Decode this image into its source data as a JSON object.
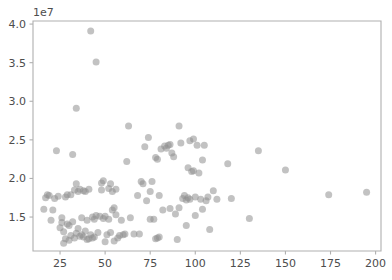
{
  "chart_data": {
    "type": "scatter",
    "title": "",
    "xlabel": "",
    "ylabel": "",
    "y_offset_text": "1e7",
    "xlim": [
      10,
      203
    ],
    "ylim": [
      10600000,
      40400000
    ],
    "xticks": [
      25,
      50,
      75,
      100,
      125,
      150,
      175,
      200
    ],
    "xtick_labels": [
      "25",
      "50",
      "75",
      "100",
      "125",
      "150",
      "175",
      "200"
    ],
    "yticks": [
      15000000,
      20000000,
      25000000,
      30000000,
      35000000,
      40000000
    ],
    "ytick_labels": [
      "1.5",
      "2.0",
      "2.5",
      "3.0",
      "3.5",
      "4.0"
    ],
    "grid": false,
    "legend": null,
    "marker": {
      "color": "#8f8f8f",
      "opacity": 0.55,
      "size_px": 7,
      "shape": "circle"
    },
    "background_color": "#ffffff",
    "spine_color": "#b0b0b0",
    "tick_label_color": "#4d4d4d",
    "series": [
      {
        "name": "points",
        "points": [
          [
            16,
            16000000
          ],
          [
            17,
            17500000
          ],
          [
            18,
            17900000
          ],
          [
            19,
            17800000
          ],
          [
            20,
            14600000
          ],
          [
            21,
            15900000
          ],
          [
            22,
            17400000
          ],
          [
            23,
            23600000
          ],
          [
            24,
            17700000
          ],
          [
            25,
            13600000
          ],
          [
            26,
            14900000
          ],
          [
            26,
            14300000
          ],
          [
            27,
            13100000
          ],
          [
            27,
            11600000
          ],
          [
            28,
            17600000
          ],
          [
            28,
            12200000
          ],
          [
            29,
            14100000
          ],
          [
            29,
            17900000
          ],
          [
            30,
            12000000
          ],
          [
            30,
            13900000
          ],
          [
            31,
            17900000
          ],
          [
            31,
            12600000
          ],
          [
            32,
            23100000
          ],
          [
            32,
            14400000
          ],
          [
            33,
            12300000
          ],
          [
            33,
            18500000
          ],
          [
            34,
            29100000
          ],
          [
            34,
            12900000
          ],
          [
            34,
            19300000
          ],
          [
            35,
            13500000
          ],
          [
            35,
            18300000
          ],
          [
            36,
            12500000
          ],
          [
            36,
            18600000
          ],
          [
            37,
            12700000
          ],
          [
            37,
            14900000
          ],
          [
            38,
            18400000
          ],
          [
            38,
            12400000
          ],
          [
            39,
            18300000
          ],
          [
            39,
            13200000
          ],
          [
            40,
            12100000
          ],
          [
            40,
            14600000
          ],
          [
            41,
            12200000
          ],
          [
            41,
            18600000
          ],
          [
            42,
            39100000
          ],
          [
            42,
            12700000
          ],
          [
            43,
            15000000
          ],
          [
            43,
            12300000
          ],
          [
            44,
            14700000
          ],
          [
            44,
            12400000
          ],
          [
            45,
            35100000
          ],
          [
            45,
            15200000
          ],
          [
            46,
            13000000
          ],
          [
            47,
            15100000
          ],
          [
            48,
            19400000
          ],
          [
            48,
            18500000
          ],
          [
            49,
            19700000
          ],
          [
            49,
            14800000
          ],
          [
            50,
            15100000
          ],
          [
            50,
            11800000
          ],
          [
            51,
            12700000
          ],
          [
            52,
            14700000
          ],
          [
            52,
            18700000
          ],
          [
            53,
            19300000
          ],
          [
            53,
            13000000
          ],
          [
            54,
            18300000
          ],
          [
            54,
            15900000
          ],
          [
            55,
            16200000
          ],
          [
            55,
            11900000
          ],
          [
            56,
            18600000
          ],
          [
            56,
            15300000
          ],
          [
            57,
            12300000
          ],
          [
            58,
            12600000
          ],
          [
            59,
            14600000
          ],
          [
            60,
            12700000
          ],
          [
            61,
            12800000
          ],
          [
            62,
            22200000
          ],
          [
            63,
            26800000
          ],
          [
            64,
            14900000
          ],
          [
            66,
            12800000
          ],
          [
            68,
            17800000
          ],
          [
            69,
            12800000
          ],
          [
            70,
            19600000
          ],
          [
            71,
            19300000
          ],
          [
            72,
            24100000
          ],
          [
            73,
            17100000
          ],
          [
            74,
            25300000
          ],
          [
            75,
            14700000
          ],
          [
            75,
            18300000
          ],
          [
            76,
            19600000
          ],
          [
            77,
            14700000
          ],
          [
            78,
            22700000
          ],
          [
            78,
            12200000
          ],
          [
            79,
            22500000
          ],
          [
            79,
            12300000
          ],
          [
            80,
            17800000
          ],
          [
            80,
            12400000
          ],
          [
            81,
            23800000
          ],
          [
            82,
            15900000
          ],
          [
            83,
            24200000
          ],
          [
            84,
            23900000
          ],
          [
            85,
            24300000
          ],
          [
            86,
            24400000
          ],
          [
            86,
            16100000
          ],
          [
            87,
            23300000
          ],
          [
            88,
            22800000
          ],
          [
            89,
            15400000
          ],
          [
            90,
            12100000
          ],
          [
            91,
            26800000
          ],
          [
            91,
            16200000
          ],
          [
            92,
            24600000
          ],
          [
            93,
            17400000
          ],
          [
            94,
            17800000
          ],
          [
            95,
            13900000
          ],
          [
            95,
            17200000
          ],
          [
            96,
            21400000
          ],
          [
            96,
            17500000
          ],
          [
            97,
            17300000
          ],
          [
            97,
            24900000
          ],
          [
            98,
            20900000
          ],
          [
            99,
            25100000
          ],
          [
            99,
            21000000
          ],
          [
            100,
            17600000
          ],
          [
            100,
            15200000
          ],
          [
            101,
            24300000
          ],
          [
            102,
            20700000
          ],
          [
            103,
            17300000
          ],
          [
            104,
            22400000
          ],
          [
            104,
            16000000
          ],
          [
            105,
            24300000
          ],
          [
            106,
            17100000
          ],
          [
            107,
            17600000
          ],
          [
            108,
            13400000
          ],
          [
            110,
            18400000
          ],
          [
            112,
            17300000
          ],
          [
            118,
            21900000
          ],
          [
            120,
            17400000
          ],
          [
            130,
            14800000
          ],
          [
            135,
            23600000
          ],
          [
            150,
            21100000
          ],
          [
            174,
            17900000
          ],
          [
            195,
            18200000
          ]
        ]
      }
    ]
  }
}
